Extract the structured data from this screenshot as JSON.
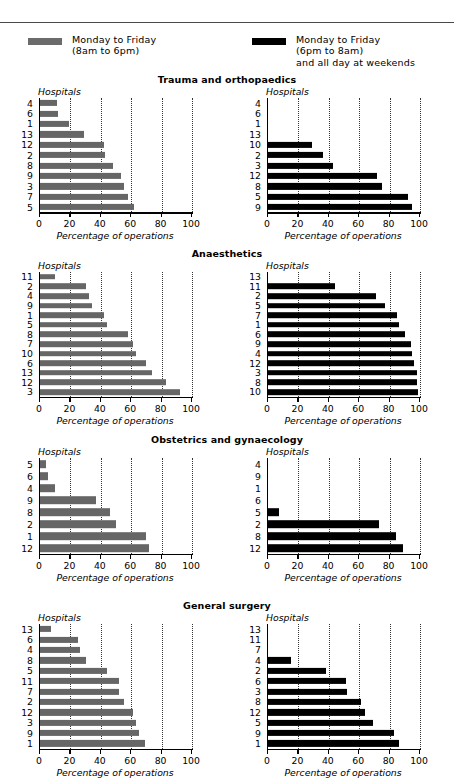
{
  "legend": {
    "items": [
      {
        "id": "day",
        "color": "#666666",
        "line1": "Monday to Friday",
        "line2": "(8am to 6pm)",
        "line3": ""
      },
      {
        "id": "night",
        "color": "#000000",
        "line1": "Monday to Friday",
        "line2": "(6pm to 8am)",
        "line3": "and all day at weekends"
      }
    ]
  },
  "axis": {
    "hospitals_label": "Hospitals",
    "xlabel": "Percentage of operations",
    "ticks": [
      0,
      20,
      40,
      60,
      80,
      100
    ],
    "xlim": [
      0,
      100
    ]
  },
  "chart_data": [
    {
      "type": "bar",
      "title": "Trauma and orthopaedics",
      "orientation": "horizontal",
      "xlabel": "Percentage of operations",
      "ylabel": "Hospitals",
      "xlim": [
        0,
        100
      ],
      "ticks": [
        0,
        20,
        40,
        60,
        80,
        100
      ],
      "grid": "vertical-dotted",
      "panels": [
        {
          "series": "Monday to Friday (8am to 6pm)",
          "color": "#666666",
          "categories": [
            "4",
            "6",
            "1",
            "13",
            "12",
            "2",
            "8",
            "9",
            "3",
            "7",
            "5"
          ],
          "values": [
            11,
            12,
            19,
            29,
            42,
            43,
            48,
            53,
            55,
            58,
            62
          ]
        },
        {
          "series": "Monday to Friday (6pm to 8am) and all day at weekends",
          "color": "#000000",
          "categories": [
            "4",
            "6",
            "1",
            "13",
            "10",
            "2",
            "3",
            "12",
            "8",
            "5",
            "9"
          ],
          "values": [
            0,
            0,
            0,
            0,
            29,
            36,
            43,
            72,
            75,
            92,
            95
          ]
        }
      ]
    },
    {
      "type": "bar",
      "title": "Anaesthetics",
      "orientation": "horizontal",
      "xlabel": "Percentage of operations",
      "ylabel": "Hospitals",
      "xlim": [
        0,
        100
      ],
      "ticks": [
        0,
        20,
        40,
        60,
        80,
        100
      ],
      "grid": "vertical-dotted",
      "panels": [
        {
          "series": "Monday to Friday (8am to 6pm)",
          "color": "#666666",
          "categories": [
            "11",
            "2",
            "4",
            "9",
            "1",
            "5",
            "8",
            "7",
            "10",
            "6",
            "13",
            "12",
            "3"
          ],
          "values": [
            10,
            30,
            32,
            34,
            42,
            44,
            58,
            61,
            63,
            70,
            74,
            83,
            92
          ]
        },
        {
          "series": "Monday to Friday (6pm to 8am) and all day at weekends",
          "color": "#000000",
          "categories": [
            "13",
            "11",
            "2",
            "5",
            "7",
            "1",
            "6",
            "9",
            "4",
            "12",
            "3",
            "8",
            "10"
          ],
          "values": [
            0,
            44,
            71,
            77,
            85,
            86,
            90,
            94,
            95,
            96,
            98,
            98,
            99
          ]
        }
      ]
    },
    {
      "type": "bar",
      "title": "Obstetrics and gynaecology",
      "orientation": "horizontal",
      "xlabel": "Percentage of operations",
      "ylabel": "Hospitals",
      "xlim": [
        0,
        100
      ],
      "ticks": [
        0,
        20,
        40,
        60,
        80,
        100
      ],
      "grid": "vertical-dotted",
      "panels": [
        {
          "series": "Monday to Friday (8am to 6pm)",
          "color": "#666666",
          "categories": [
            "5",
            "6",
            "4",
            "9",
            "8",
            "2",
            "1",
            "12"
          ],
          "values": [
            4,
            5,
            10,
            37,
            46,
            50,
            70,
            72
          ]
        },
        {
          "series": "Monday to Friday (6pm to 8am) and all day at weekends",
          "color": "#000000",
          "categories": [
            "4",
            "9",
            "1",
            "6",
            "5",
            "2",
            "8",
            "12"
          ],
          "values": [
            0,
            0,
            0,
            0,
            7,
            73,
            84,
            89
          ]
        }
      ]
    },
    {
      "type": "bar",
      "title": "General surgery",
      "orientation": "horizontal",
      "xlabel": "Percentage of operations",
      "ylabel": "Hospitals",
      "xlim": [
        0,
        100
      ],
      "ticks": [
        0,
        20,
        40,
        60,
        80,
        100
      ],
      "grid": "vertical-dotted",
      "panels": [
        {
          "series": "Monday to Friday (8am to 6pm)",
          "color": "#666666",
          "categories": [
            "13",
            "6",
            "4",
            "8",
            "5",
            "11",
            "7",
            "2",
            "12",
            "3",
            "9",
            "1"
          ],
          "values": [
            7,
            25,
            26,
            30,
            44,
            52,
            52,
            55,
            61,
            63,
            65,
            69
          ]
        },
        {
          "series": "Monday to Friday (6pm to 8am) and all day at weekends",
          "color": "#000000",
          "categories": [
            "13",
            "11",
            "7",
            "4",
            "2",
            "6",
            "3",
            "8",
            "12",
            "5",
            "9",
            "1"
          ],
          "values": [
            0,
            0,
            0,
            15,
            38,
            51,
            52,
            61,
            64,
            69,
            83,
            86
          ]
        }
      ]
    }
  ]
}
